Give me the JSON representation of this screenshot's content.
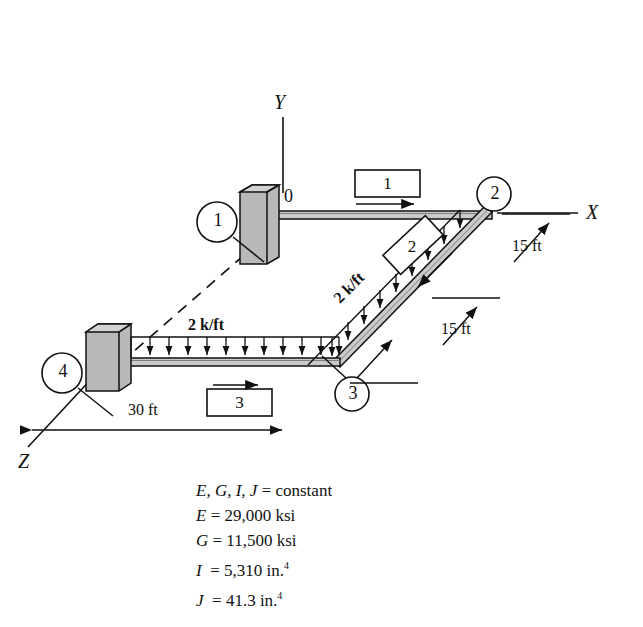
{
  "figure": {
    "type": "structural-frame-diagram",
    "axes": [
      {
        "name": "Y",
        "label": "Y",
        "direction": "up"
      },
      {
        "name": "X",
        "label": "X",
        "direction": "right"
      },
      {
        "name": "Z",
        "label": "Z",
        "direction": "down-left"
      }
    ],
    "nodes": [
      {
        "id": "0",
        "label": "0",
        "circled": false
      },
      {
        "id": "1",
        "label": "1",
        "circled": true
      },
      {
        "id": "2",
        "label": "2",
        "circled": true
      },
      {
        "id": "3",
        "label": "3",
        "circled": true
      },
      {
        "id": "4",
        "label": "4",
        "circled": true
      }
    ],
    "members": [
      {
        "id": "1",
        "label": "1",
        "box": "rect",
        "arrow": "right"
      },
      {
        "id": "2",
        "label": "2",
        "box": "rotated",
        "arrow": "down-left"
      },
      {
        "id": "3",
        "label": "3",
        "box": "rect",
        "arrow": "right"
      }
    ],
    "loads": [
      {
        "member": "2",
        "label": "2 k/ft",
        "orientation": "inclined",
        "direction": "down"
      },
      {
        "member": "3",
        "label": "2 k/ft",
        "orientation": "horizontal",
        "direction": "down"
      }
    ],
    "dimensions": [
      {
        "label": "15 ft",
        "id": "dim-15ft-upper"
      },
      {
        "label": "15 ft",
        "id": "dim-15ft-lower"
      },
      {
        "label": "30 ft",
        "id": "dim-30ft"
      }
    ],
    "supports": [
      {
        "at_node": "0",
        "marker": "1",
        "type": "fixed"
      },
      {
        "at_node": "4",
        "marker": "4",
        "type": "fixed"
      }
    ]
  },
  "properties": {
    "line1_sym": "E, G, I, J",
    "line1_eq": " = constant",
    "line2_sym": "E",
    "line2_eq": " = 29,000 ksi",
    "line3_sym": "G",
    "line3_eq": " = 11,500 ksi",
    "line4_sym": "I",
    "line4_eq": "  = 5,310 in.",
    "line4_sup": "4",
    "line5_sym": "J",
    "line5_eq": "  = 41.3 in.",
    "line5_sup": "4"
  },
  "colors": {
    "line": "#111111",
    "support_fill": "#b8b8b8",
    "support_top": "#d2d2d2",
    "beam_fill": "#c9c9c9",
    "background": "#ffffff"
  }
}
